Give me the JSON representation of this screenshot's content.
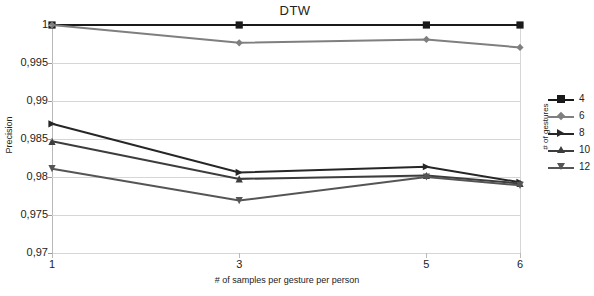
{
  "chart_data": {
    "type": "line",
    "title": "DTW",
    "xlabel": "# of samples per gesture per person",
    "ylabel": "Precision",
    "legend_title": "# of gestures",
    "legend_position": "right",
    "grid": true,
    "x": [
      1,
      3,
      5,
      6
    ],
    "xtick_labels": [
      "1",
      "3",
      "5",
      "6"
    ],
    "ytick_labels": [
      "1",
      "0,995",
      "0,99",
      "0,985",
      "0,98",
      "0,975",
      "0,97"
    ],
    "ytick_values": [
      1,
      0.995,
      0.99,
      0.985,
      0.98,
      0.975,
      0.97
    ],
    "ylim": [
      0.97,
      1.0
    ],
    "xlim": [
      1,
      6
    ],
    "series": [
      {
        "name": "4",
        "values": [
          1.0,
          1.0,
          1.0,
          1.0
        ],
        "color": "#1a1a1a",
        "marker": "square"
      },
      {
        "name": "6",
        "values": [
          1.0,
          0.99765,
          0.9981,
          0.99705
        ],
        "color": "#7f7f7f",
        "marker": "diamond"
      },
      {
        "name": "8",
        "values": [
          0.987,
          0.9806,
          0.98135,
          0.9793
        ],
        "color": "#262626",
        "marker": "triangle-right"
      },
      {
        "name": "10",
        "values": [
          0.9847,
          0.97975,
          0.9802,
          0.97915
        ],
        "color": "#3d3d3d",
        "marker": "triangle-up"
      },
      {
        "name": "12",
        "values": [
          0.9811,
          0.9769,
          0.98,
          0.9789
        ],
        "color": "#555555",
        "marker": "triangle-down"
      }
    ]
  },
  "legend": {
    "title": "# of gestures",
    "entries": [
      "4",
      "6",
      "8",
      "10",
      "12"
    ]
  }
}
